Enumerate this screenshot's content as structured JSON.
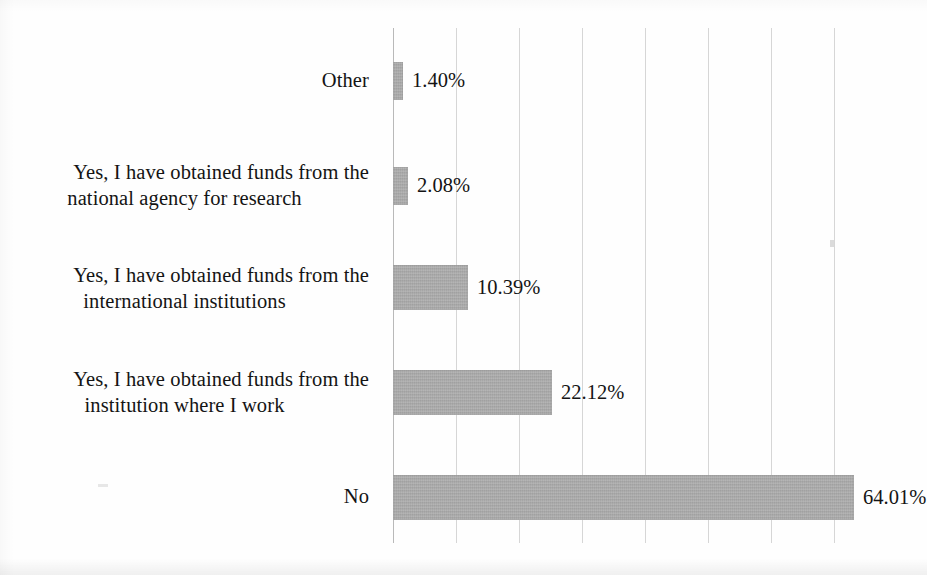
{
  "chart_data": {
    "type": "bar",
    "orientation": "horizontal",
    "title": "",
    "subtitle": "",
    "xlabel": "",
    "ylabel": "",
    "categories": [
      "Other",
      "Yes, I have obtained funds from the national agency for research",
      "Yes, I have obtained funds from the international institutions",
      "Yes, I have obtained funds from the institution where I work",
      "No"
    ],
    "category_lines": [
      [
        "Other"
      ],
      [
        "Yes, I have obtained funds from the",
        "national agency for research"
      ],
      [
        "Yes, I have obtained funds from the",
        "international institutions"
      ],
      [
        "Yes, I have obtained funds from the",
        "institution where I work"
      ],
      [
        "No"
      ]
    ],
    "values": [
      1.4,
      2.08,
      10.39,
      22.12,
      64.01
    ],
    "data_labels": [
      "1.40%",
      "2.08%",
      "10.39%",
      "22.12%",
      "64.01%"
    ],
    "xlim": [
      0,
      70
    ],
    "x_tick_interval": 8.75,
    "x_tick_count": 8,
    "grid": true,
    "grid_axis": "x",
    "tick_labels_visible": false,
    "legend": false,
    "legend_position": "none",
    "bar_color": "#a6a6a6",
    "grid_color": "#d6d6d6",
    "axis_color": "#b9b9b9",
    "text_color": "#141414",
    "background": "#fefefe"
  }
}
